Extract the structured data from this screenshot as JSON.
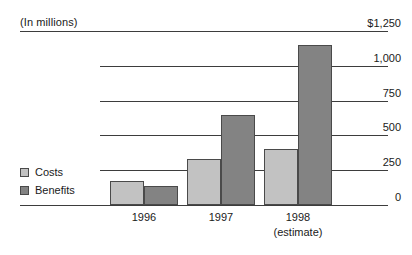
{
  "chart_data": {
    "type": "bar",
    "title": "",
    "subtitle": "",
    "units_caption": "(In millions)",
    "xlabel": "",
    "ylabel": "",
    "categories": [
      "1996",
      "1997",
      "1998"
    ],
    "category_sublabels": [
      "",
      "",
      "(estimate)"
    ],
    "series": [
      {
        "name": "Costs",
        "values": [
          170,
          330,
          400
        ],
        "color": "#c2c2c2"
      },
      {
        "name": "Benefits",
        "values": [
          140,
          650,
          1150
        ],
        "color": "#838383"
      }
    ],
    "ylim": [
      0,
      1250
    ],
    "ytick_values": [
      1250,
      1000,
      750,
      500,
      250,
      0
    ],
    "ytick_labels": [
      "$1,250",
      "1,000",
      "750",
      "500",
      "250",
      "0"
    ],
    "y_axis_position": "right",
    "grid": true,
    "grid_axis": "y",
    "legend_position": "bottom-left",
    "bar_border_color": "#4a4a4a",
    "axis_color": "#3d3d3d",
    "background_color": "#ffffff"
  },
  "legend": {
    "items": [
      {
        "label": "Costs"
      },
      {
        "label": "Benefits"
      }
    ]
  }
}
